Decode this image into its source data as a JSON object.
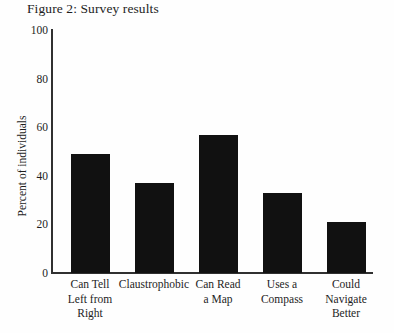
{
  "figure": {
    "title": "Figure 2: Survey results",
    "background_color": "#fefefe",
    "axis_color": "#303030",
    "bar_color": "#111111"
  },
  "chart_data": {
    "type": "bar",
    "title": "Figure 2: Survey results",
    "xlabel": "",
    "ylabel": "Percent of individuals",
    "ylim": [
      0,
      100
    ],
    "yticks": [
      0,
      20,
      40,
      60,
      80,
      100
    ],
    "ytick_labels": [
      "0",
      "20",
      "40",
      "60",
      "80",
      "100"
    ],
    "grid": false,
    "legend": false,
    "categories": [
      "Can Tell Left from Right",
      "Claustrophobic",
      "Can Read a Map",
      "Uses a Compass",
      "Could Navigate Better"
    ],
    "category_label_lines": [
      [
        "Can Tell",
        "Left from",
        "Right"
      ],
      [
        "Claustrophobic"
      ],
      [
        "Can Read",
        "a Map"
      ],
      [
        "Uses a",
        "Compass"
      ],
      [
        "Could",
        "Navigate",
        "Better"
      ]
    ],
    "values": [
      49,
      37,
      57,
      33,
      21
    ],
    "series": [
      {
        "name": "Percent of individuals",
        "values": [
          49,
          37,
          57,
          33,
          21
        ]
      }
    ]
  }
}
